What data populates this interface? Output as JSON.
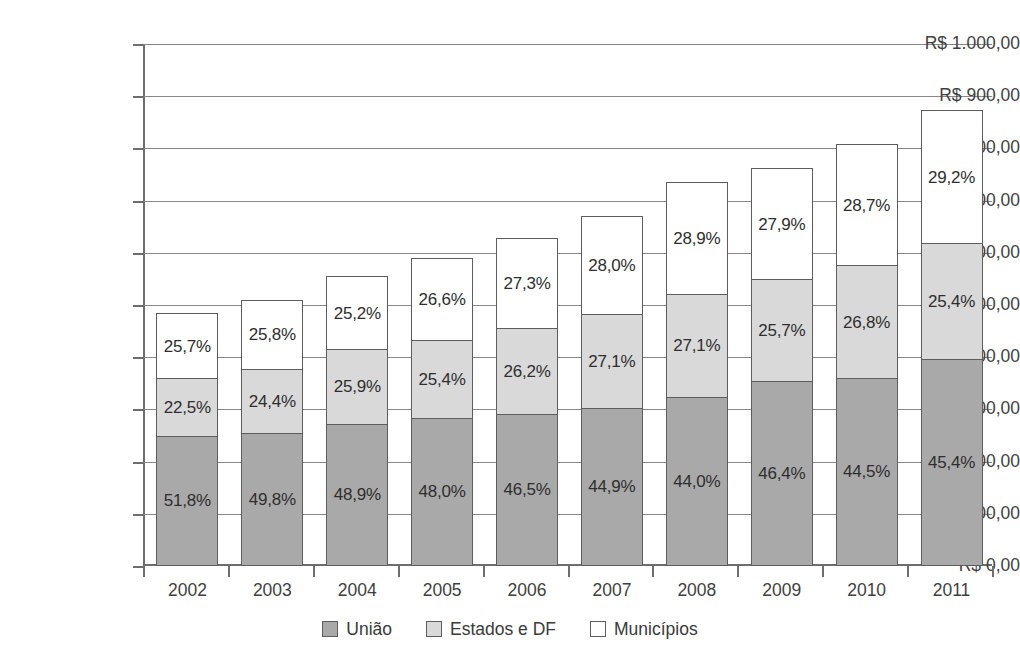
{
  "chart_data": {
    "type": "bar",
    "stacked": true,
    "title": "",
    "xlabel": "",
    "ylabel": "",
    "grid": true,
    "legend_position": "bottom",
    "ylim": [
      0,
      1000
    ],
    "categories": [
      "2002",
      "2003",
      "2004",
      "2005",
      "2006",
      "2007",
      "2008",
      "2009",
      "2010",
      "2011"
    ],
    "ytick_labels": [
      "R$ 0,00",
      "R$ 100,00",
      "R$ 200,00",
      "R$ 300,00",
      "R$ 400,00",
      "R$ 500,00",
      "R$ 600,00",
      "R$ 700,00",
      "R$ 800,00",
      "R$ 900,00",
      "R$ 1.000,00"
    ],
    "ytick_values": [
      0,
      100,
      200,
      300,
      400,
      500,
      600,
      700,
      800,
      900,
      1000
    ],
    "series": [
      {
        "name": "União",
        "color": "#a9a9a9",
        "values": [
          248,
          252,
          270,
          282,
          290,
          300,
          322,
          352,
          358,
          395
        ],
        "labels": [
          "51,8%",
          "49,8%",
          "48,9%",
          "48,0%",
          "46,5%",
          "44,9%",
          "44,0%",
          "46,4%",
          "44,5%",
          "45,4%"
        ]
      },
      {
        "name": "Estados e DF",
        "color": "#d9d9d9",
        "values": [
          110,
          124,
          143,
          149,
          164,
          181,
          198,
          195,
          216,
          221
        ],
        "labels": [
          "22,5%",
          "24,4%",
          "25,9%",
          "25,4%",
          "26,2%",
          "27,1%",
          "27,1%",
          "25,7%",
          "26,8%",
          "25,4%"
        ]
      },
      {
        "name": "Municípios",
        "color": "#ffffff",
        "values": [
          124,
          131,
          139,
          156,
          171,
          187,
          212,
          212,
          231,
          254
        ],
        "labels": [
          "25,7%",
          "25,8%",
          "25,2%",
          "26,6%",
          "27,3%",
          "28,0%",
          "28,9%",
          "27,9%",
          "28,7%",
          "29,2%"
        ]
      }
    ],
    "totals": [
      482,
      508,
      554,
      588,
      625,
      668,
      733,
      760,
      805,
      870
    ]
  },
  "legend": {
    "items": [
      {
        "label": "União",
        "color": "#a9a9a9"
      },
      {
        "label": "Estados e DF",
        "color": "#d9d9d9"
      },
      {
        "label": "Municípios",
        "color": "#ffffff"
      }
    ]
  }
}
